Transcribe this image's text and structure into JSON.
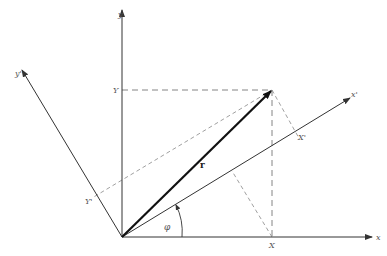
{
  "diagram": {
    "colors": {
      "line": "#333333",
      "dashed": "#777777",
      "vector": "#111111",
      "background": "#ffffff"
    },
    "axes": {
      "x": {
        "label": "x"
      },
      "y": {
        "label": "y"
      },
      "x_prime": {
        "label": "x'"
      },
      "y_prime": {
        "label": "y'"
      }
    },
    "vector": {
      "label": "r"
    },
    "angle": {
      "label": "φ"
    },
    "projections": {
      "X": "X",
      "Y": "Y",
      "X_prime": "X'",
      "Y_prime": "Y'"
    }
  }
}
